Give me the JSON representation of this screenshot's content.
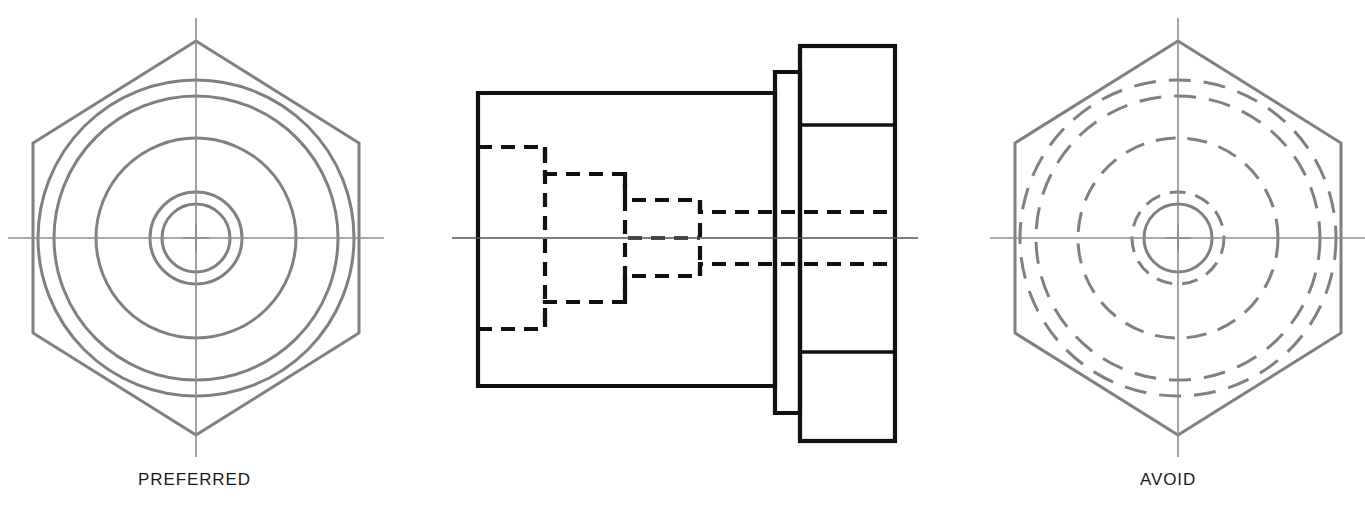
{
  "page": {
    "width": 1365,
    "height": 519,
    "background": "#ffffff"
  },
  "style": {
    "visible_line_color": "#111111",
    "hidden_line_color": "#111111",
    "object_line_color_views": "#808080",
    "center_line_color": "#8c8c8c",
    "text_color": "#1a1a1a",
    "visible_line_width": 4.2,
    "hidden_line_width": 4.2,
    "view_line_width": 3.0,
    "center_line_width": 1.4,
    "hidden_dash": "13,9",
    "center_dash": "26,5,6,5"
  },
  "labels": {
    "left": "PREFERRED",
    "right": "AVOID"
  },
  "views": {
    "left": {
      "name": "preferred-end-view",
      "caption": "PREFERRED",
      "center_x": 196,
      "center_y": 238,
      "hexagon_circumradius": 197,
      "hexagon_flat_half_width": 163,
      "hexagon_orientation": "vertex-up",
      "center_mark_arm": 13,
      "centerline_h": {
        "x1": 8,
        "x2": 384,
        "y": 238
      },
      "centerline_v": {
        "y1": 18,
        "y2": 457,
        "x": 196
      },
      "circles": [
        {
          "name": "circle-outer-body",
          "r": 158,
          "style": "solid"
        },
        {
          "name": "circle-collar",
          "r": 142,
          "style": "solid"
        },
        {
          "name": "circle-shank",
          "r": 100,
          "style": "solid"
        },
        {
          "name": "circle-step-2",
          "r": 46,
          "style": "solid"
        },
        {
          "name": "circle-step-1",
          "r": 34,
          "style": "solid"
        }
      ]
    },
    "right": {
      "name": "avoid-end-view",
      "caption": "AVOID",
      "center_x": 1178,
      "center_y": 238,
      "hexagon_circumradius": 197,
      "hexagon_flat_half_width": 163,
      "hexagon_orientation": "vertex-up",
      "center_mark_arm": 13,
      "centerline_h": {
        "x1": 990,
        "x2": 1366,
        "y": 238
      },
      "centerline_v": {
        "y1": 18,
        "y2": 457,
        "x": 1178
      },
      "circles": [
        {
          "name": "circle-outer-body",
          "r": 158,
          "style": "dashed"
        },
        {
          "name": "circle-collar",
          "r": 142,
          "style": "dashed"
        },
        {
          "name": "circle-shank",
          "r": 100,
          "style": "dashed"
        },
        {
          "name": "circle-step-2",
          "r": 46,
          "style": "dashed"
        },
        {
          "name": "circle-step-1",
          "r": 34,
          "style": "solid"
        }
      ]
    },
    "front": {
      "name": "front-section-view",
      "axis_y": 238,
      "centerline_h": {
        "x1": 452,
        "x2": 918,
        "y": 238
      },
      "body": {
        "x1": 478,
        "y1": 93,
        "x2": 775,
        "y2": 386
      },
      "collar": {
        "x1": 775,
        "y1": 72,
        "x2": 800,
        "y2": 413
      },
      "flange": {
        "x1": 800,
        "y1": 46,
        "x2": 895,
        "y2": 441
      },
      "flange_flats": {
        "top_y": 125,
        "bottom_y": 352
      },
      "hidden_steps": [
        {
          "name": "step-1-outer",
          "x_start": 478,
          "x_end": 545,
          "y_top": 147,
          "y_bottom": 329
        },
        {
          "name": "step-2",
          "x_start": 545,
          "x_end": 625,
          "y_top": 174,
          "y_bottom": 302
        },
        {
          "name": "step-3",
          "x_start": 625,
          "x_end": 700,
          "y_top": 200,
          "y_bottom": 276
        },
        {
          "name": "step-4-bore",
          "x_start": 700,
          "x_end": 895,
          "y_top": 212,
          "y_bottom": 264
        }
      ]
    }
  }
}
